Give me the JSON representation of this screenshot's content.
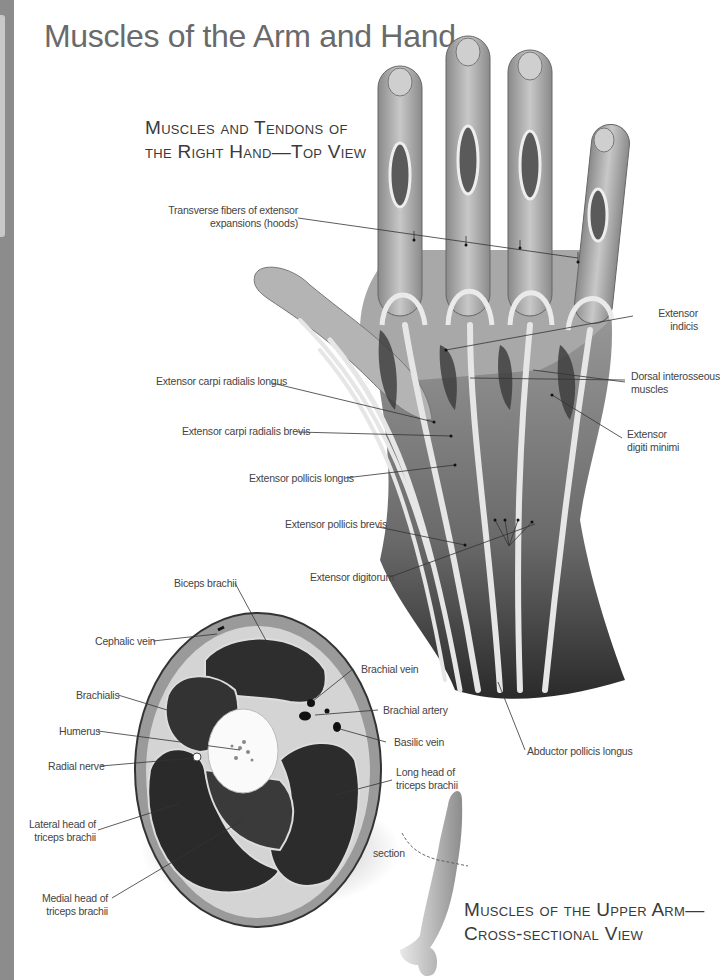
{
  "page": {
    "title": "Muscles of the Arm and Hand"
  },
  "hand_figure": {
    "heading_line1": "Muscles and Tendons of",
    "heading_line2": "the Right Hand—Top View",
    "labels": {
      "transverse_1": "Transverse fibers of extensor",
      "transverse_2": "expansions (hoods)",
      "extensor_indicis_1": "Extensor",
      "extensor_indicis_2": "indicis",
      "dorsal_1": "Dorsal interosseous",
      "dorsal_2": "muscles",
      "edm_1": "Extensor",
      "edm_2": "digiti minimi",
      "ecrl": "Extensor carpi radialis longus",
      "ecrb": "Extensor carpi radialis brevis",
      "epl": "Extensor pollicis longus",
      "epb": "Extensor pollicis brevis",
      "ed": "Extensor digitorum",
      "apl": "Abductor pollicis longus"
    }
  },
  "cross_section_figure": {
    "heading_line1": "Muscles of the Upper Arm—",
    "heading_line2": "Cross-sectional View",
    "labels": {
      "biceps": "Biceps brachii",
      "cephalic": "Cephalic vein",
      "brachialis": "Brachialis",
      "humerus": "Humerus",
      "radial_nerve": "Radial nerve",
      "lateral_1": "Lateral head of",
      "lateral_2": "triceps brachii",
      "medial_1": "Medial head of",
      "medial_2": "triceps brachii",
      "brachial_vein": "Brachial vein",
      "brachial_artery": "Brachial artery",
      "basilic": "Basilic vein",
      "long_head_1": "Long head of",
      "long_head_2": "triceps brachii",
      "section": "section"
    }
  }
}
